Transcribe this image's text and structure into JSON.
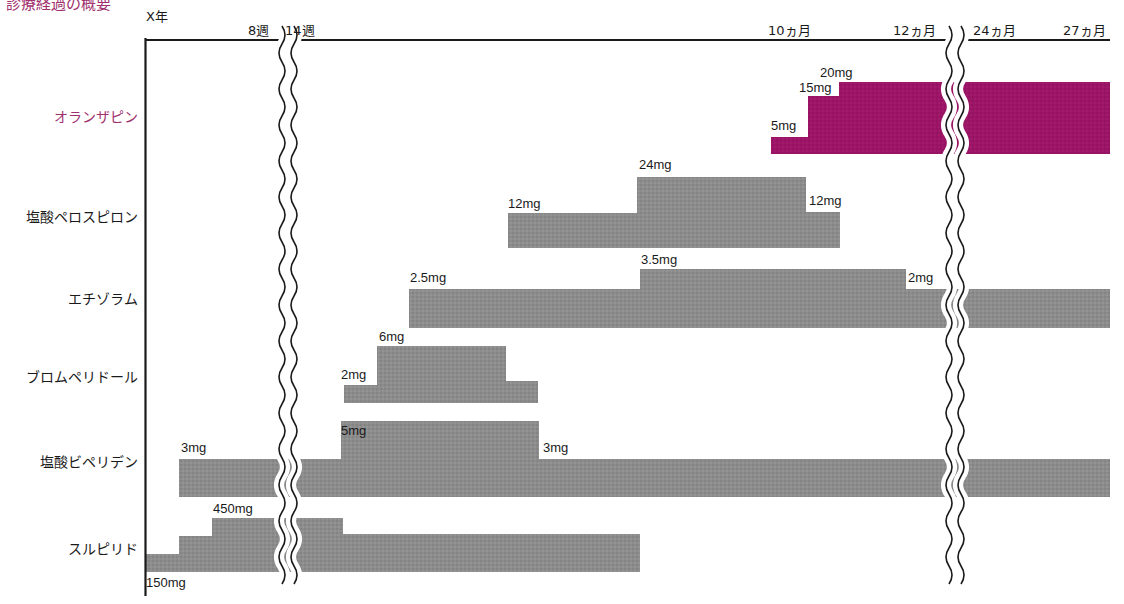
{
  "title_partial": "診療経過の概要",
  "chart_data": {
    "type": "timeline-step-bar",
    "title": "X年",
    "x_axis": {
      "origin_label": "X年",
      "ticks": [
        {
          "label": "8週",
          "x": 270
        },
        {
          "label": "14週",
          "x": 307
        },
        {
          "label": "10ヵ月",
          "x": 790
        },
        {
          "label": "12ヵ月",
          "x": 915
        },
        {
          "label": "24ヵ月",
          "x": 995
        },
        {
          "label": "27ヵ月",
          "x": 1085
        }
      ],
      "breaks": [
        {
          "between": [
            "8週",
            "14週"
          ],
          "x": 288
        },
        {
          "between": [
            "12ヵ月",
            "24ヵ月"
          ],
          "x": 955
        }
      ]
    },
    "colors": {
      "olanzapine": "#9b1466",
      "other": "#8a8a8a"
    },
    "series": [
      {
        "name": "オランザピン",
        "highlight": true,
        "segments": [
          {
            "dose": "5mg",
            "x0": 771,
            "x1": 808,
            "top": 137,
            "bottom": 154
          },
          {
            "dose": "15mg",
            "x0": 808,
            "x1": 839,
            "top": 96,
            "bottom": 154
          },
          {
            "dose": "20mg",
            "x0": 839,
            "x1": 1110,
            "top": 82,
            "bottom": 154
          }
        ]
      },
      {
        "name": "塩酸ペロスピロン",
        "segments": [
          {
            "dose": "12mg",
            "x0": 508,
            "x1": 637,
            "top": 213,
            "bottom": 248
          },
          {
            "dose": "24mg",
            "x0": 637,
            "x1": 806,
            "top": 177,
            "bottom": 248
          },
          {
            "dose": "12mg",
            "x0": 806,
            "x1": 840,
            "top": 212,
            "bottom": 248
          }
        ]
      },
      {
        "name": "エチゾラム",
        "segments": [
          {
            "dose": "2.5mg",
            "x0": 409,
            "x1": 640,
            "top": 289,
            "bottom": 328
          },
          {
            "dose": "3.5mg",
            "x0": 640,
            "x1": 906,
            "top": 269,
            "bottom": 328
          },
          {
            "dose": "2mg",
            "x0": 906,
            "x1": 1110,
            "top": 289,
            "bottom": 328
          }
        ]
      },
      {
        "name": "ブロムペリドール",
        "segments": [
          {
            "dose": "2mg",
            "x0": 344,
            "x1": 377,
            "top": 385,
            "bottom": 403
          },
          {
            "dose": "6mg",
            "x0": 377,
            "x1": 506,
            "top": 346,
            "bottom": 403
          },
          {
            "dose": "",
            "x0": 506,
            "x1": 538,
            "top": 381,
            "bottom": 403
          }
        ]
      },
      {
        "name": "塩酸ビペリデン",
        "segments": [
          {
            "dose": "3mg",
            "x0": 179,
            "x1": 341,
            "top": 459,
            "bottom": 497
          },
          {
            "dose": "5mg",
            "x0": 341,
            "x1": 539,
            "top": 421,
            "bottom": 497
          },
          {
            "dose": "3mg",
            "x0": 539,
            "x1": 1110,
            "top": 459,
            "bottom": 497
          }
        ]
      },
      {
        "name": "スルピリド",
        "segments": [
          {
            "dose": "150mg",
            "x0": 146,
            "x1": 179,
            "top": 554,
            "bottom": 572
          },
          {
            "dose": "",
            "x0": 179,
            "x1": 212,
            "top": 536,
            "bottom": 572
          },
          {
            "dose": "450mg",
            "x0": 212,
            "x1": 343,
            "top": 518,
            "bottom": 572
          },
          {
            "dose": "",
            "x0": 343,
            "x1": 640,
            "top": 534,
            "bottom": 572
          }
        ]
      }
    ],
    "dose_labels": [
      {
        "text": "20mg",
        "x": 820,
        "y": 65
      },
      {
        "text": "15mg",
        "x": 799,
        "y": 80
      },
      {
        "text": "5mg",
        "x": 771,
        "y": 118
      },
      {
        "text": "24mg",
        "x": 639,
        "y": 157
      },
      {
        "text": "12mg",
        "x": 508,
        "y": 196
      },
      {
        "text": "12mg",
        "x": 809,
        "y": 193
      },
      {
        "text": "3.5mg",
        "x": 641,
        "y": 252
      },
      {
        "text": "2.5mg",
        "x": 410,
        "y": 270
      },
      {
        "text": "2mg",
        "x": 908,
        "y": 270
      },
      {
        "text": "6mg",
        "x": 379,
        "y": 329
      },
      {
        "text": "2mg",
        "x": 341,
        "y": 367
      },
      {
        "text": "5mg",
        "x": 341,
        "y": 423
      },
      {
        "text": "3mg",
        "x": 181,
        "y": 440
      },
      {
        "text": "3mg",
        "x": 543,
        "y": 440
      },
      {
        "text": "450mg",
        "x": 213,
        "y": 501
      },
      {
        "text": "150mg",
        "x": 146,
        "y": 575
      }
    ],
    "row_labels": [
      {
        "text": "オランザピン",
        "y": 115,
        "color": "#a0306e"
      },
      {
        "text": "塩酸ペロスピロン",
        "y": 215,
        "color": "#1a1a1a"
      },
      {
        "text": "エチゾラム",
        "y": 297,
        "color": "#1a1a1a"
      },
      {
        "text": "ブロムペリドール",
        "y": 375,
        "color": "#1a1a1a"
      },
      {
        "text": "塩酸ビペリデン",
        "y": 460,
        "color": "#1a1a1a"
      },
      {
        "text": "スルピリド",
        "y": 547,
        "color": "#1a1a1a"
      }
    ]
  }
}
